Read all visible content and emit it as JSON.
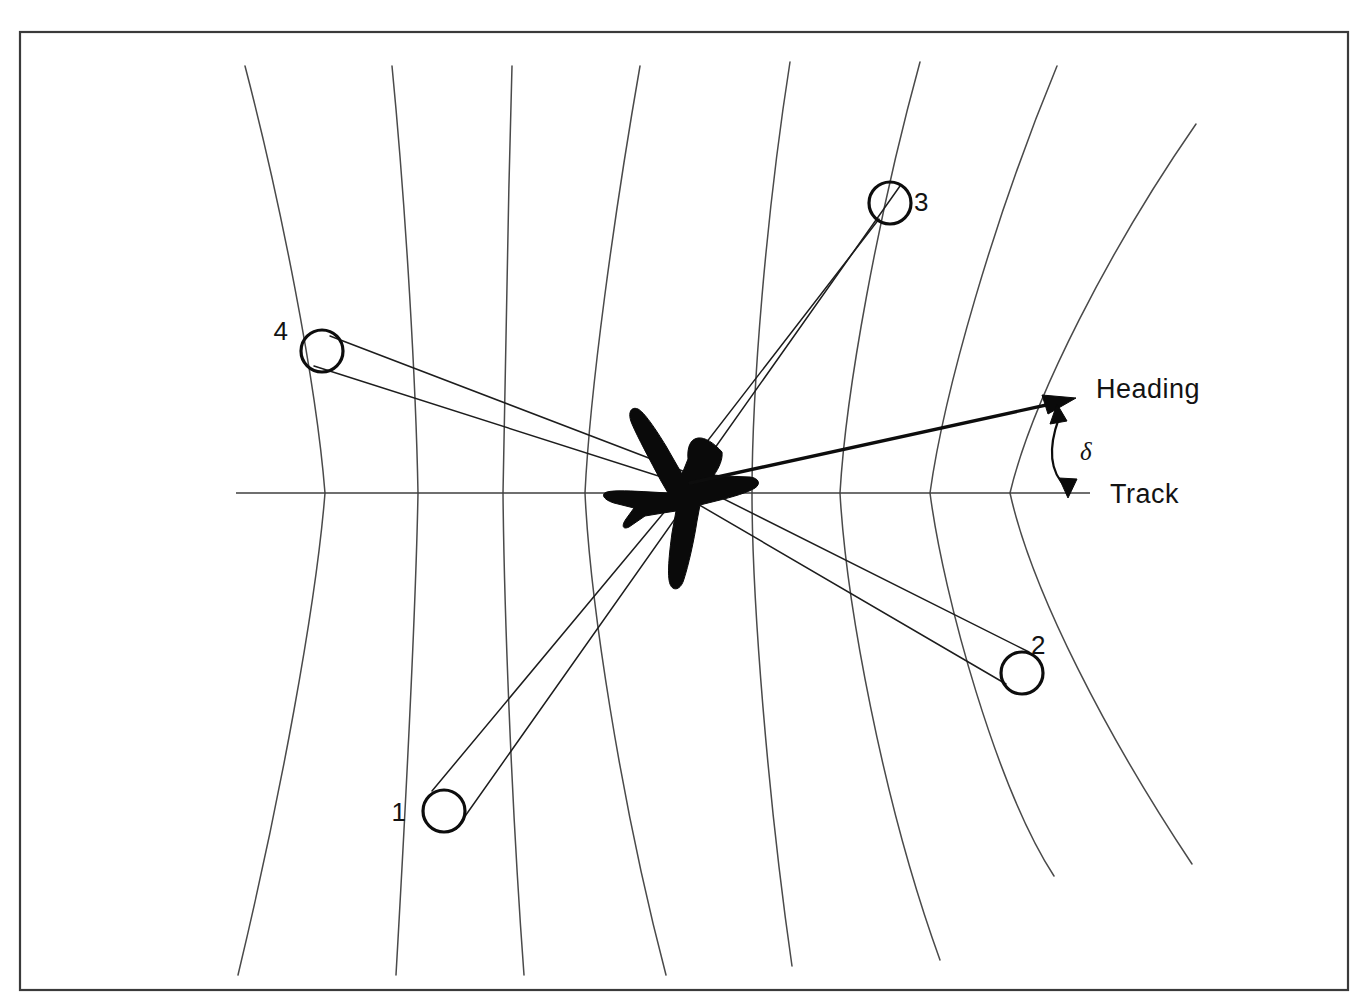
{
  "figure": {
    "kind": "doppler-radar-beam-geometry-diagram",
    "background_color": "#ffffff",
    "line_color": "#1d1d1d",
    "curve_color": "#4a4a4a",
    "frame": {
      "x": 20,
      "y": 32,
      "width": 1328,
      "height": 958
    }
  },
  "labels": {
    "heading": "Heading",
    "track": "Track",
    "drift_angle_symbol": "δ"
  },
  "aircraft": {
    "name": "aircraft-silhouette",
    "origin_x": 690,
    "origin_y": 478
  },
  "track_line": {
    "name": "track-axis",
    "x1": 236,
    "x2": 1090,
    "y": 493
  },
  "heading_vector": {
    "name": "heading-axis",
    "x1": 690,
    "y1": 483,
    "x2": 1068,
    "y2": 400,
    "arrow": "single-ended"
  },
  "drift_angle": {
    "name": "drift-angle-arc",
    "symbol": "δ",
    "label_x": 1080,
    "label_y": 456,
    "from_x": 1057,
    "from_y": 412,
    "to_x": 1067,
    "to_y": 493,
    "arrow": "double-ended"
  },
  "beams": [
    {
      "id": "1",
      "label": "1",
      "spot_x": 444,
      "spot_y": 811,
      "spot_r": 21,
      "label_x": 406,
      "label_y": 821
    },
    {
      "id": "2",
      "label": "2",
      "spot_x": 1022,
      "spot_y": 673,
      "spot_r": 21,
      "label_x": 1031,
      "label_y": 654
    },
    {
      "id": "3",
      "label": "3",
      "spot_x": 890,
      "spot_y": 203,
      "spot_r": 21,
      "label_x": 914,
      "label_y": 211
    },
    {
      "id": "4",
      "label": "4",
      "spot_x": 322,
      "spot_y": 351,
      "spot_r": 21,
      "label_x": 288,
      "label_y": 340
    }
  ],
  "iso_doppler_curves": {
    "count": 8,
    "description": "Lines of constant Doppler frequency, symmetric about the track axis",
    "track_crossings_x": [
      325,
      418,
      503,
      585,
      752,
      840,
      930,
      1010
    ],
    "top_endpoints_x": [
      245,
      392,
      512,
      640,
      790,
      920,
      1057,
      1180
    ],
    "bottom_endpoints_x": [
      235,
      395,
      525,
      668,
      790,
      940,
      1050,
      1180
    ]
  }
}
